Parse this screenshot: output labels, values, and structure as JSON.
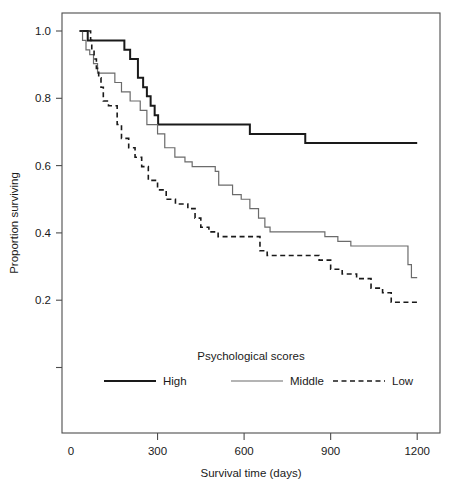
{
  "chart_data": {
    "type": "line",
    "subtype": "kaplan-meier-step",
    "title": "",
    "xlabel": "Survival time (days)",
    "ylabel": "Proportion surviving",
    "xlim": [
      0,
      1275
    ],
    "ylim": [
      -0.035,
      1.045
    ],
    "grid": false,
    "xticks": [
      0,
      300,
      600,
      900,
      1200
    ],
    "xticklabels": [
      "0",
      "300",
      "600",
      "900",
      "1200"
    ],
    "yticks": [
      0.0,
      0.2,
      0.4,
      0.6,
      0.8,
      1.0
    ],
    "yticklabels": [
      "",
      "0.2",
      "0.4",
      "0.6",
      "0.8",
      "1.0"
    ],
    "legend": {
      "title": "Psychological scores",
      "position": "inside-bottom-center",
      "entries": [
        {
          "name": "High",
          "style": "solid",
          "color": "#1a1a1a",
          "width": 2.0
        },
        {
          "name": "Middle",
          "style": "solid",
          "color": "#6b6b6b",
          "width": 1.2
        },
        {
          "name": "Low",
          "style": "dashed",
          "color": "#1a1a1a",
          "width": 1.6
        }
      ]
    },
    "series": [
      {
        "name": "High",
        "style": "solid",
        "color": "#1a1a1a",
        "width": 2.0,
        "points": [
          [
            30,
            1.0
          ],
          [
            58,
            1.0
          ],
          [
            58,
            0.972
          ],
          [
            185,
            0.972
          ],
          [
            185,
            0.944
          ],
          [
            205,
            0.944
          ],
          [
            205,
            0.917
          ],
          [
            232,
            0.917
          ],
          [
            232,
            0.861
          ],
          [
            250,
            0.861
          ],
          [
            250,
            0.833
          ],
          [
            263,
            0.833
          ],
          [
            263,
            0.806
          ],
          [
            276,
            0.806
          ],
          [
            276,
            0.778
          ],
          [
            290,
            0.778
          ],
          [
            290,
            0.75
          ],
          [
            302,
            0.75
          ],
          [
            302,
            0.722
          ],
          [
            620,
            0.722
          ],
          [
            620,
            0.694
          ],
          [
            812,
            0.694
          ],
          [
            812,
            0.667
          ],
          [
            1200,
            0.667
          ]
        ]
      },
      {
        "name": "Middle",
        "style": "solid",
        "color": "#6b6b6b",
        "width": 1.2,
        "points": [
          [
            30,
            1.0
          ],
          [
            40,
            1.0
          ],
          [
            40,
            0.972
          ],
          [
            52,
            0.972
          ],
          [
            52,
            0.944
          ],
          [
            65,
            0.944
          ],
          [
            65,
            0.93
          ],
          [
            78,
            0.93
          ],
          [
            78,
            0.903
          ],
          [
            92,
            0.903
          ],
          [
            92,
            0.875
          ],
          [
            152,
            0.875
          ],
          [
            152,
            0.847
          ],
          [
            175,
            0.847
          ],
          [
            175,
            0.819
          ],
          [
            205,
            0.819
          ],
          [
            205,
            0.792
          ],
          [
            240,
            0.792
          ],
          [
            240,
            0.764
          ],
          [
            263,
            0.764
          ],
          [
            263,
            0.722
          ],
          [
            300,
            0.722
          ],
          [
            300,
            0.694
          ],
          [
            325,
            0.694
          ],
          [
            325,
            0.653
          ],
          [
            360,
            0.653
          ],
          [
            360,
            0.625
          ],
          [
            395,
            0.625
          ],
          [
            395,
            0.611
          ],
          [
            420,
            0.611
          ],
          [
            420,
            0.597
          ],
          [
            500,
            0.597
          ],
          [
            500,
            0.583
          ],
          [
            512,
            0.583
          ],
          [
            512,
            0.542
          ],
          [
            560,
            0.542
          ],
          [
            560,
            0.514
          ],
          [
            590,
            0.514
          ],
          [
            590,
            0.5
          ],
          [
            620,
            0.5
          ],
          [
            620,
            0.472
          ],
          [
            650,
            0.472
          ],
          [
            650,
            0.444
          ],
          [
            672,
            0.444
          ],
          [
            672,
            0.417
          ],
          [
            690,
            0.417
          ],
          [
            690,
            0.403
          ],
          [
            845,
            0.403
          ],
          [
            845,
            0.403
          ],
          [
            880,
            0.403
          ],
          [
            880,
            0.389
          ],
          [
            925,
            0.389
          ],
          [
            925,
            0.375
          ],
          [
            970,
            0.375
          ],
          [
            970,
            0.361
          ],
          [
            1168,
            0.361
          ],
          [
            1168,
            0.306
          ],
          [
            1180,
            0.306
          ],
          [
            1180,
            0.267
          ],
          [
            1200,
            0.267
          ]
        ]
      },
      {
        "name": "Low",
        "style": "dashed",
        "color": "#1a1a1a",
        "width": 1.6,
        "points": [
          [
            30,
            1.0
          ],
          [
            68,
            1.0
          ],
          [
            68,
            0.972
          ],
          [
            72,
            0.972
          ],
          [
            72,
            0.944
          ],
          [
            80,
            0.944
          ],
          [
            80,
            0.917
          ],
          [
            88,
            0.917
          ],
          [
            88,
            0.889
          ],
          [
            96,
            0.889
          ],
          [
            96,
            0.861
          ],
          [
            104,
            0.861
          ],
          [
            104,
            0.833
          ],
          [
            112,
            0.833
          ],
          [
            112,
            0.792
          ],
          [
            130,
            0.792
          ],
          [
            130,
            0.778
          ],
          [
            160,
            0.778
          ],
          [
            160,
            0.722
          ],
          [
            175,
            0.722
          ],
          [
            175,
            0.681
          ],
          [
            200,
            0.681
          ],
          [
            200,
            0.653
          ],
          [
            222,
            0.653
          ],
          [
            222,
            0.625
          ],
          [
            245,
            0.625
          ],
          [
            245,
            0.597
          ],
          [
            268,
            0.597
          ],
          [
            268,
            0.556
          ],
          [
            300,
            0.556
          ],
          [
            300,
            0.528
          ],
          [
            330,
            0.528
          ],
          [
            330,
            0.5
          ],
          [
            362,
            0.5
          ],
          [
            362,
            0.486
          ],
          [
            405,
            0.486
          ],
          [
            405,
            0.472
          ],
          [
            430,
            0.472
          ],
          [
            430,
            0.444
          ],
          [
            450,
            0.444
          ],
          [
            450,
            0.417
          ],
          [
            478,
            0.417
          ],
          [
            478,
            0.403
          ],
          [
            510,
            0.403
          ],
          [
            510,
            0.389
          ],
          [
            625,
            0.389
          ],
          [
            625,
            0.389
          ],
          [
            655,
            0.389
          ],
          [
            655,
            0.347
          ],
          [
            680,
            0.347
          ],
          [
            680,
            0.333
          ],
          [
            830,
            0.333
          ],
          [
            830,
            0.333
          ],
          [
            860,
            0.333
          ],
          [
            860,
            0.319
          ],
          [
            900,
            0.319
          ],
          [
            900,
            0.292
          ],
          [
            940,
            0.292
          ],
          [
            940,
            0.278
          ],
          [
            990,
            0.278
          ],
          [
            990,
            0.264
          ],
          [
            1040,
            0.264
          ],
          [
            1040,
            0.236
          ],
          [
            1080,
            0.236
          ],
          [
            1080,
            0.222
          ],
          [
            1110,
            0.222
          ],
          [
            1110,
            0.194
          ],
          [
            1200,
            0.194
          ]
        ]
      }
    ]
  },
  "geometry": {
    "plot_left": 62,
    "plot_right": 440,
    "plot_top": 13,
    "plot_bottom": 433,
    "x_zero_px": 71,
    "x_px_per_day": 0.2885,
    "y_one_px": 31,
    "y_px_per_unit": 336.5
  }
}
